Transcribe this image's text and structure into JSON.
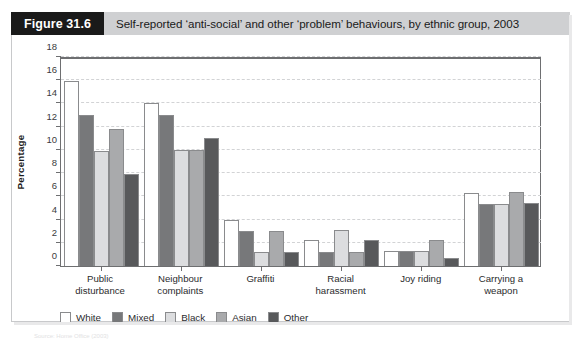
{
  "header": {
    "figure_label": "Figure 31.6",
    "title": "Self-reported ‘anti-social’ and other ‘problem’ behaviours, by ethnic group, 2003"
  },
  "colors": {
    "white": "#ffffff",
    "mixed": "#77787a",
    "black": "#dcdddf",
    "asian": "#a9aaac",
    "other": "#58595b",
    "header_bar": "#cfd0d2",
    "figure_label_bg": "#1a1a1a",
    "axis": "#6e6f71",
    "grid": "#d2d3d5"
  },
  "chart_data": {
    "type": "bar",
    "title": "Self-reported ‘anti-social’ and other ‘problem’ behaviours, by ethnic group, 2003",
    "xlabel": "",
    "ylabel": "Percentage",
    "ylim": [
      0,
      18
    ],
    "ytick_step": 2,
    "yticks": [
      0,
      2,
      4,
      6,
      8,
      10,
      12,
      14,
      16,
      18
    ],
    "grid": true,
    "legend_position": "below-left",
    "categories": [
      "Public\ndisturbance",
      "Neighbour\ncomplaints",
      "Graffiti",
      "Racial\nharassment",
      "Joy riding",
      "Carrying a\nweapon"
    ],
    "category_lines": [
      [
        "Public",
        "disturbance"
      ],
      [
        "Neighbour",
        "complaints"
      ],
      [
        "Graffiti",
        ""
      ],
      [
        "Racial",
        "harassment"
      ],
      [
        "Joy riding",
        ""
      ],
      [
        "Carrying a",
        "weapon"
      ]
    ],
    "series": [
      {
        "name": "White",
        "color": "#ffffff",
        "values": [
          15.9,
          14.0,
          4.0,
          2.2,
          1.3,
          6.3
        ]
      },
      {
        "name": "Mixed",
        "color": "#77787a",
        "values": [
          13.0,
          13.0,
          3.0,
          1.2,
          1.3,
          5.3
        ]
      },
      {
        "name": "Black",
        "color": "#dcdddf",
        "values": [
          9.9,
          10.0,
          1.2,
          3.1,
          1.3,
          5.3
        ]
      },
      {
        "name": "Asian",
        "color": "#a9aaac",
        "values": [
          11.8,
          10.0,
          3.0,
          1.2,
          2.2,
          6.4
        ]
      },
      {
        "name": "Other",
        "color": "#58595b",
        "values": [
          7.9,
          11.0,
          1.2,
          2.2,
          0.7,
          5.4
        ]
      }
    ]
  },
  "footnote": "Source: Home Office (2003)"
}
